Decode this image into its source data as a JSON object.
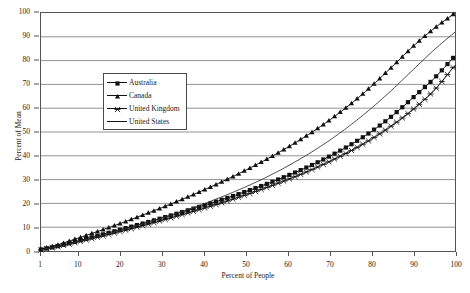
{
  "chart_data": {
    "type": "line",
    "title": "",
    "xlabel": "Percent of People",
    "ylabel": "Percent of Mean",
    "xlim": [
      1,
      100
    ],
    "ylim": [
      0,
      100
    ],
    "grid": "horizontal",
    "legend_position": "upper-left-inside",
    "xticks": [
      1,
      10,
      20,
      30,
      40,
      50,
      60,
      70,
      80,
      90,
      100
    ],
    "yticks": [
      0,
      10,
      20,
      30,
      40,
      50,
      60,
      70,
      80,
      90,
      100
    ],
    "x": [
      1,
      5,
      10,
      15,
      20,
      25,
      30,
      35,
      40,
      45,
      50,
      55,
      60,
      65,
      70,
      75,
      80,
      85,
      90,
      95,
      100
    ],
    "series": [
      {
        "name": "Australia",
        "marker": "square",
        "color": "#111111",
        "values": [
          0.6,
          2.0,
          4.3,
          6.6,
          9.0,
          11.4,
          13.9,
          16.5,
          19.2,
          22.0,
          25.0,
          28.2,
          31.7,
          35.5,
          39.8,
          44.6,
          50.2,
          56.8,
          64.5,
          72.5,
          82.0
        ]
      },
      {
        "name": "Canada",
        "marker": "triangle",
        "color": "#111111",
        "values": [
          0.8,
          2.6,
          5.5,
          8.5,
          11.6,
          14.9,
          18.3,
          21.9,
          25.7,
          29.7,
          34.0,
          38.6,
          43.6,
          49.0,
          55.0,
          61.7,
          69.2,
          77.5,
          86.0,
          93.5,
          100.0
        ]
      },
      {
        "name": "United Kingdom",
        "marker": "star",
        "color": "#111111",
        "values": [
          0.5,
          1.8,
          3.9,
          6.0,
          8.2,
          10.5,
          12.9,
          15.4,
          18.0,
          20.7,
          23.6,
          26.7,
          30.0,
          33.6,
          37.6,
          42.0,
          47.0,
          52.8,
          59.5,
          67.5,
          78.0
        ]
      },
      {
        "name": "United States",
        "marker": "none",
        "color": "#333333",
        "values": [
          0.5,
          1.8,
          4.0,
          6.3,
          8.7,
          11.2,
          13.9,
          16.8,
          19.9,
          23.3,
          27.0,
          31.1,
          35.7,
          40.8,
          46.5,
          52.9,
          60.0,
          67.8,
          76.2,
          84.5,
          92.0
        ]
      }
    ]
  },
  "legend": {
    "items": [
      {
        "label": "Australia",
        "marker": "square-marker"
      },
      {
        "label": "Canada",
        "marker": "triangle-marker"
      },
      {
        "label": "United Kingdom",
        "marker": "star-marker"
      },
      {
        "label": "United States",
        "marker": "line-only-marker"
      }
    ]
  }
}
